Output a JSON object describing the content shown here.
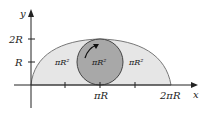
{
  "diagram": {
    "y_axis_label": "y",
    "x_axis_label": "x",
    "y_ticks": [
      "2R",
      "R"
    ],
    "x_ticks": [
      "πR",
      "2πR"
    ],
    "region_labels": [
      "πR²",
      "πR²",
      "πR²"
    ],
    "colors": {
      "cycloid_fill": "#e6e6e6",
      "circle_fill": "#a8a8a8",
      "stroke": "#555555",
      "axis": "#222222"
    }
  }
}
